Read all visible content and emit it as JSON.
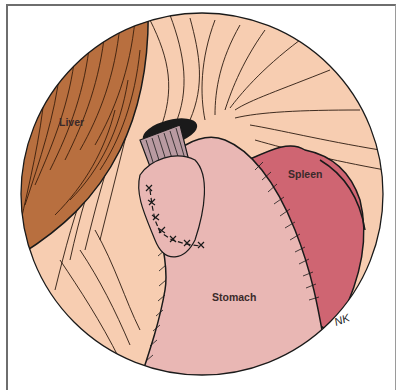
{
  "illustration": {
    "type": "endoscopic/laparoscopic anatomical view",
    "labels": {
      "liver": "Liver",
      "spleen": "Spleen",
      "stomach": "Stomach"
    },
    "signature": "NK",
    "colors": {
      "background": "#ffffff",
      "frame": "#6e6e6e",
      "tissue": "#f7cdb1",
      "liver": "#b86f3f",
      "spleen": "#cf6572",
      "stomach": "#e9b7b4",
      "esophagus": "#b99aa1",
      "outline": "#1a1a1a"
    }
  }
}
